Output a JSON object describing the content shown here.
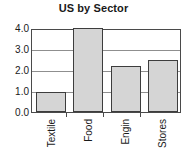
{
  "chart_data": {
    "type": "bar",
    "title": "US by Sector",
    "xlabel": "",
    "ylabel": "",
    "categories": [
      "Textile",
      "Food",
      "Engin",
      "Stores"
    ],
    "values": [
      0.95,
      4.0,
      2.2,
      2.5
    ],
    "ylim": [
      0.0,
      4.0
    ],
    "yticks": [
      "0.0",
      "1.0",
      "2.0",
      "3.0",
      "4.0"
    ],
    "ytick_values": [
      0.0,
      1.0,
      2.0,
      3.0,
      4.0
    ],
    "grid": true,
    "grid_axis": "y",
    "legend": false,
    "legend_position": "none",
    "bar_fill_color": "#d5d5d5",
    "bar_edge_color": "#3d3d3d",
    "axis_color": "#4a4a4a",
    "grid_color": "#8f8f8f",
    "text_color": "#1a1a1a",
    "background_color": "#ffffff",
    "xtick_label_rotation": 90
  }
}
